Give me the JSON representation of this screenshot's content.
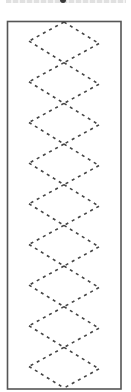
{
  "caption": {
    "text": "",
    "clipped": true
  },
  "diagram": {
    "name": "stitch-lacing-pattern",
    "diamond_count": 9,
    "frame_color": "#555555",
    "stitch_color": "#444444",
    "line_style": "dashed"
  }
}
